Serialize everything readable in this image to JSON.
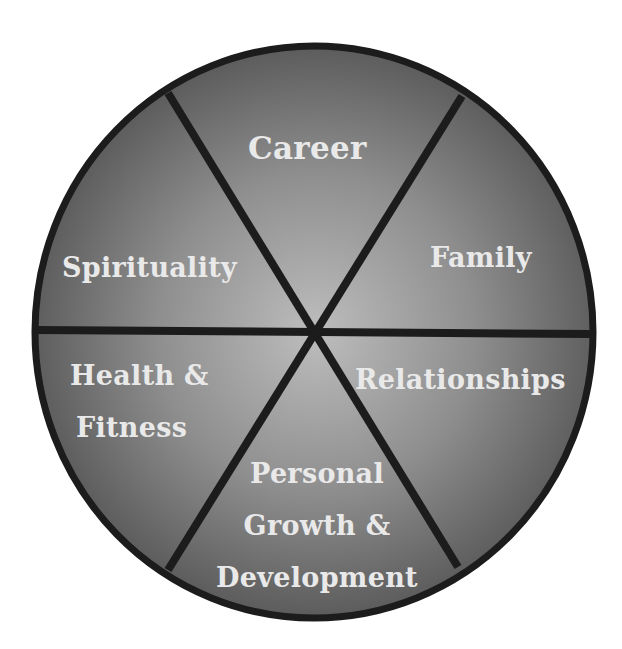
{
  "diagram": {
    "type": "wheel-of-life",
    "colors": {
      "center": "#b8b8b8",
      "edge": "#5e5e5e",
      "outline": "#1c1c1c",
      "text": "#e9e9e9",
      "background": "#ffffff"
    },
    "segments": [
      {
        "id": "career",
        "label": "Career"
      },
      {
        "id": "family",
        "label": "Family"
      },
      {
        "id": "relationships",
        "label": "Relationships"
      },
      {
        "id": "personal-growth",
        "lines": [
          "Personal",
          "Growth &",
          "Development"
        ]
      },
      {
        "id": "health",
        "lines": [
          "Health &",
          "Fitness"
        ]
      },
      {
        "id": "spirituality",
        "label": "Spirituality"
      }
    ]
  }
}
